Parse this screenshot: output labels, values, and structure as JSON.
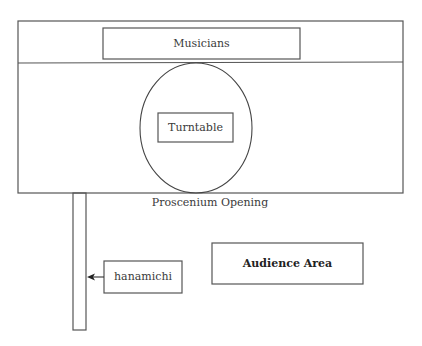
{
  "diagram": {
    "type": "stage_floor_plan",
    "colors": {
      "line": "#555555",
      "background": "#ffffff",
      "text": "#333333"
    },
    "labels": {
      "musicians": "Musicians",
      "turntable": "Turntable",
      "proscenium": "Proscenium Opening",
      "hanamichi": "hanamichi",
      "audience": "Audience Area"
    }
  }
}
